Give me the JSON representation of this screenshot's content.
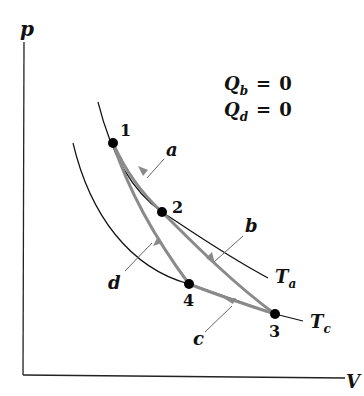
{
  "axes": {
    "y_label": "p",
    "x_label": "V"
  },
  "conditions": [
    {
      "symbol": "Q",
      "subscript": "b",
      "equals": "=",
      "value": "0"
    },
    {
      "symbol": "Q",
      "subscript": "d",
      "equals": "=",
      "value": "0"
    }
  ],
  "points": [
    {
      "label": "1"
    },
    {
      "label": "2"
    },
    {
      "label": "3"
    },
    {
      "label": "4"
    }
  ],
  "processes": [
    {
      "label": "a"
    },
    {
      "label": "b"
    },
    {
      "label": "c"
    },
    {
      "label": "d"
    }
  ],
  "isotherms": [
    {
      "symbol": "T",
      "subscript": "a"
    },
    {
      "symbol": "T",
      "subscript": "c"
    }
  ],
  "colors": {
    "path": "#8a8a8a",
    "line": "#111111",
    "point": "#000000"
  }
}
